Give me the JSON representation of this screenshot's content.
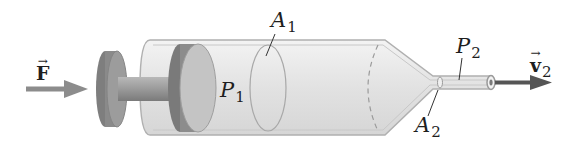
{
  "figure": {
    "labels": {
      "force": {
        "symbol": "F",
        "vector": true,
        "bold": true
      },
      "area_1": {
        "symbol": "A",
        "subscript": "1"
      },
      "pressure_1": {
        "symbol": "P",
        "subscript": "1"
      },
      "pressure_2": {
        "symbol": "P",
        "subscript": "2"
      },
      "area_2": {
        "symbol": "A",
        "subscript": "2"
      },
      "velocity_2": {
        "symbol": "v",
        "subscript": "2",
        "vector": true,
        "bold": true
      }
    },
    "colors": {
      "background": "#ffffff",
      "barrel_fill": "#e6e6e6",
      "barrel_outline": "#b0b0b0",
      "plunger_dark": "#7a7a7a",
      "plunger_mid": "#9a9a9a",
      "plunger_light": "#c4c4c4",
      "force_arrow": "#8c8c8c",
      "velocity_arrow": "#555555",
      "text": "#1e1e1e"
    }
  }
}
